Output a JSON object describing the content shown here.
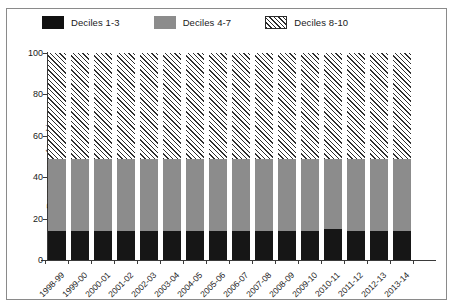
{
  "chart_data": {
    "type": "bar",
    "subtype": "stacked-100",
    "title": "",
    "xlabel": "",
    "ylabel": "Percentage of total income",
    "ylim": [
      0,
      100
    ],
    "yticks": [
      0,
      20,
      40,
      60,
      80,
      100
    ],
    "grid": false,
    "legend_position": "top",
    "categories": [
      "1998-99",
      "1999-00",
      "2000-01",
      "2001-02",
      "2002-03",
      "2003-04",
      "2004-05",
      "2005-06",
      "2006-07",
      "2007-08",
      "2008-09",
      "2009-10",
      "2010-11",
      "2011-12",
      "2012-13",
      "2013-14"
    ],
    "series": [
      {
        "name": "Deciles 1-3",
        "color": "#161616",
        "pattern": "solid",
        "values": [
          14,
          14,
          14,
          14,
          14,
          14,
          14,
          14,
          14,
          14,
          14,
          14,
          15,
          14,
          14,
          14
        ]
      },
      {
        "name": "Deciles 4-7",
        "color": "#8c8c8c",
        "pattern": "solid",
        "values": [
          35,
          35,
          35,
          35,
          35,
          35,
          35,
          35,
          35,
          35,
          35,
          35,
          34,
          35,
          35,
          35
        ]
      },
      {
        "name": "Deciles 8-10",
        "color": "#ffffff",
        "pattern": "diagonal-hatch",
        "values": [
          51,
          51,
          51,
          51,
          51,
          51,
          51,
          51,
          51,
          51,
          51,
          51,
          51,
          51,
          51,
          51
        ]
      }
    ]
  },
  "legend": {
    "items": [
      {
        "label": "Deciles 1-3",
        "swatch": "black-swatch"
      },
      {
        "label": "Deciles 4-7",
        "swatch": "gray-swatch"
      },
      {
        "label": "Deciles 8-10",
        "swatch": "hatched-swatch"
      }
    ]
  },
  "axes": {
    "y_title": "Percentage of total income",
    "y_tick_labels": [
      "0",
      "20",
      "40",
      "60",
      "80",
      "100"
    ]
  }
}
